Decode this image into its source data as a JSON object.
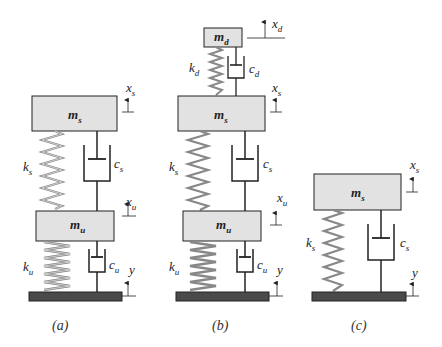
{
  "figure": {
    "panels": [
      {
        "id": "a",
        "caption": "(a)",
        "masses": {
          "sprung": "m_s",
          "unsprung": "m_u"
        },
        "springs": {
          "upper": "k_s",
          "lower": "k_u"
        },
        "dampers": {
          "upper": "c_s",
          "lower": "c_u"
        },
        "displacements": {
          "sprung": "x_s",
          "unsprung": "x_u",
          "road": "y"
        }
      },
      {
        "id": "b",
        "caption": "(b)",
        "masses": {
          "dynamic": "m_d",
          "sprung": "m_s",
          "unsprung": "m_u"
        },
        "springs": {
          "top": "k_d",
          "upper": "k_s",
          "lower": "k_u"
        },
        "dampers": {
          "top": "c_d",
          "upper": "c_s",
          "lower": "c_u"
        },
        "displacements": {
          "dynamic": "x_d",
          "sprung": "x_s",
          "unsprung": "x_u",
          "road": "y"
        }
      },
      {
        "id": "c",
        "caption": "(c)",
        "masses": {
          "sprung": "m_s"
        },
        "springs": {
          "main": "k_s"
        },
        "dampers": {
          "main": "c_s"
        },
        "displacements": {
          "sprung": "x_s",
          "road": "y"
        }
      }
    ],
    "labels": {
      "a_ms": "m",
      "a_ms_sub": "s",
      "a_mu": "m",
      "a_mu_sub": "u",
      "a_ks": "k",
      "a_ks_sub": "s",
      "a_ku": "k",
      "a_ku_sub": "u",
      "a_cs": "c",
      "a_cs_sub": "s",
      "a_cu": "c",
      "a_cu_sub": "u",
      "a_xs": "x",
      "a_xs_sub": "s",
      "a_xu": "x",
      "a_xu_sub": "u",
      "a_y": "y",
      "b_md": "m",
      "b_md_sub": "d",
      "b_kd": "k",
      "b_kd_sub": "d",
      "b_cd": "c",
      "b_cd_sub": "d",
      "b_xd": "x",
      "b_xd_sub": "d",
      "b_ms": "m",
      "b_ms_sub": "s",
      "b_mu": "m",
      "b_mu_sub": "u",
      "b_ks": "k",
      "b_ks_sub": "s",
      "b_ku": "k",
      "b_ku_sub": "u",
      "b_cs": "c",
      "b_cs_sub": "s",
      "b_cu": "c",
      "b_cu_sub": "u",
      "b_xs": "x",
      "b_xs_sub": "s",
      "b_xu": "x",
      "b_xu_sub": "u",
      "b_y": "y",
      "c_ms": "m",
      "c_ms_sub": "s",
      "c_ks": "k",
      "c_ks_sub": "s",
      "c_cs": "c",
      "c_cs_sub": "s",
      "c_xs": "x",
      "c_xs_sub": "s",
      "c_y": "y"
    },
    "colors": {
      "mass_fill": "#e2e2e2",
      "ground_fill": "#4a4a4a",
      "spring": "#888888",
      "line": "#222222"
    }
  }
}
